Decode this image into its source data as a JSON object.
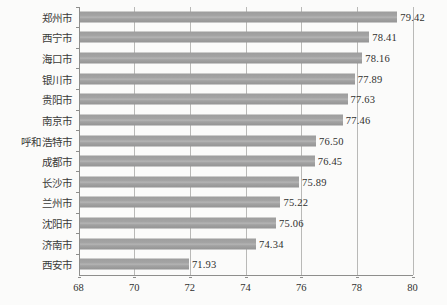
{
  "chart_data": {
    "type": "bar",
    "orientation": "horizontal",
    "title": "",
    "xlabel": "",
    "ylabel": "",
    "xlim": [
      68,
      80
    ],
    "xticks": [
      "68",
      "70",
      "72",
      "74",
      "76",
      "78",
      "80"
    ],
    "grid": true,
    "legend": false,
    "bar_color": "#a0a0a0",
    "categories": [
      "郑州市",
      "西宁市",
      "海口市",
      "银川市",
      "贵阳市",
      "南京市",
      "呼和浩特市",
      "成都市",
      "长沙市",
      "兰州市",
      "沈阳市",
      "济南市",
      "西安市"
    ],
    "values": [
      79.42,
      78.41,
      78.16,
      77.89,
      77.63,
      77.46,
      76.5,
      76.45,
      75.89,
      75.22,
      75.06,
      74.34,
      71.93
    ],
    "value_labels": [
      "79.42",
      "78.41",
      "78.16",
      "77.89",
      "77.63",
      "77.46",
      "76.50",
      "76.45",
      "75.89",
      "75.22",
      "75.06",
      "74.34",
      "71.93"
    ]
  }
}
